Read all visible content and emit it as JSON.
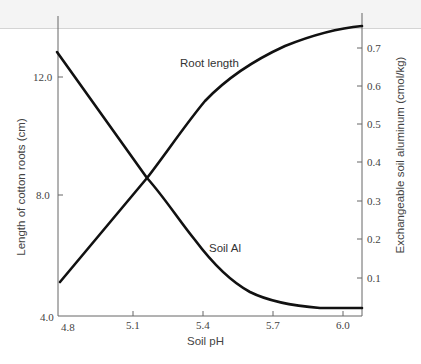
{
  "chart_data": {
    "type": "line",
    "title": "",
    "xlabel": "Soil pH",
    "ylabel": "Length of cotton roots (cm)",
    "y2label": "Exchangeable soil aluminum (cmol/kg)",
    "xlim": [
      4.8,
      6.09
    ],
    "ylim": [
      4.0,
      13.8
    ],
    "y2lim": [
      0.0,
      0.78
    ],
    "x_ticks": [
      "4.8",
      "5.1",
      "5.4",
      "5.7",
      "6.0"
    ],
    "y_ticks": [
      "4.0",
      "8.0",
      "12.0"
    ],
    "y2_ticks": [
      "0.1",
      "0.2",
      "0.3",
      "0.4",
      "0.5",
      "0.6",
      "0.7"
    ],
    "grid": false,
    "legend": "inline labels on curves",
    "series": [
      {
        "name": "Root length",
        "axis": "left",
        "x": [
          4.8,
          5.16,
          5.39,
          5.52,
          5.74,
          6.09
        ],
        "values": [
          5.1,
          8.6,
          11.0,
          12.1,
          13.0,
          13.7
        ]
      },
      {
        "name": "Soil Al",
        "axis": "right",
        "x": [
          4.8,
          5.16,
          5.31,
          5.44,
          5.56,
          5.69,
          5.82,
          6.0,
          6.09
        ],
        "values": [
          0.69,
          0.36,
          0.25,
          0.15,
          0.073,
          0.042,
          0.026,
          0.021,
          0.021
        ]
      }
    ]
  },
  "labels": {
    "x_axis_title": "Soil pH",
    "y_axis_title": "Length of cotton roots (cm)",
    "y2_axis_title": "Exchangeable soil aluminum (cmol/kg)",
    "root_length": "Root length",
    "soil_al": "Soil Al",
    "x_ticks": [
      "4.8",
      "5.1",
      "5.4",
      "5.7",
      "6.0"
    ],
    "y_ticks": [
      "4.0",
      "8.0",
      "12.0"
    ],
    "y2_ticks": [
      "0.1",
      "0.2",
      "0.3",
      "0.4",
      "0.5",
      "0.6",
      "0.7"
    ]
  },
  "colors": {
    "line": "#111111",
    "axis": "#555555",
    "background": "#ffffff"
  }
}
